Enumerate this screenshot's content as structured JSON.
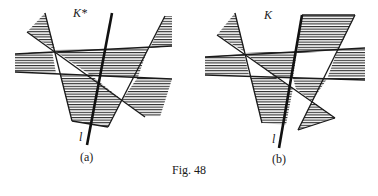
{
  "figure": {
    "caption": "Fig. 48",
    "panels": [
      {
        "id": "a",
        "label": "(a)",
        "set_label": "K*",
        "line_label": "l"
      },
      {
        "id": "b",
        "label": "(b)",
        "set_label": "K",
        "line_label": "l"
      }
    ],
    "colors": {
      "ink": "#1a1a1a",
      "hatch": "#2a2a2a",
      "background": "#ffffff"
    }
  }
}
